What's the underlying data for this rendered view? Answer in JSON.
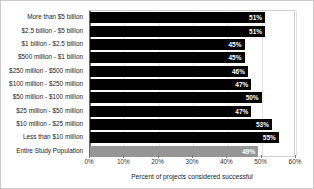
{
  "chart_data": {
    "type": "bar",
    "orientation": "horizontal",
    "title": "",
    "subtitle": "",
    "xlabel": "Percent of projects considered successful",
    "ylabel": "",
    "xlim": [
      0,
      60
    ],
    "xticks": [
      "0%",
      "10%",
      "20%",
      "30%",
      "40%",
      "50%",
      "60%"
    ],
    "xtick_values": [
      0,
      10,
      20,
      30,
      40,
      50,
      60
    ],
    "grid": true,
    "legend": "none",
    "categories": [
      "More than $5 billion",
      "$2.5 billion - $5 billion",
      "$1 billion - $2.5 billion",
      "$500 million - $1 billion",
      "$250 million - $500 million",
      "$100 million - $250 million",
      "$50 million - $100 million",
      "$25 million - $50 million",
      "$10 million - $25 million",
      "Less than $10 million",
      "Entire Study Population"
    ],
    "values": [
      51,
      51,
      45,
      45,
      46,
      47,
      50,
      47,
      53,
      55,
      49
    ],
    "value_labels": [
      "51%",
      "51%",
      "45%",
      "45%",
      "46%",
      "47%",
      "50%",
      "47%",
      "53%",
      "55%",
      "49%"
    ],
    "bar_colors": [
      "#000000",
      "#000000",
      "#000000",
      "#000000",
      "#000000",
      "#000000",
      "#000000",
      "#000000",
      "#000000",
      "#000000",
      "#969696"
    ],
    "series": [
      {
        "name": "Percent of projects considered successful",
        "values": [
          51,
          51,
          45,
          45,
          46,
          47,
          50,
          47,
          53,
          55,
          49
        ]
      }
    ]
  },
  "colors": {
    "bar_primary": "#000000",
    "bar_highlight": "#969696",
    "grid": "#e2e2e2",
    "axis": "#6b6b6b",
    "value_text": "#ffffff",
    "label_text": "#222222",
    "background": "#ffffff"
  }
}
